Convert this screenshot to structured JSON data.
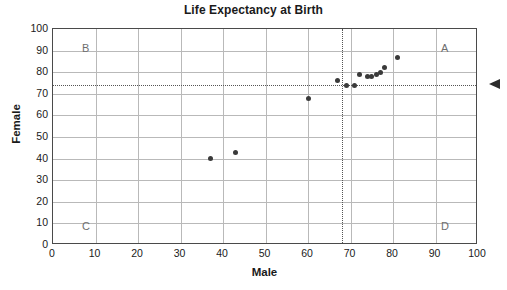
{
  "chart": {
    "title": "Life Expectancy at Birth",
    "xlabel": "Male",
    "ylabel": "Female",
    "quadrants": {
      "top_left": "B",
      "top_right": "A",
      "bottom_left": "C",
      "bottom_right": "D"
    },
    "arrow_marker_name": "reference-line-arrow"
  },
  "chart_data": {
    "type": "scatter",
    "title": "Life Expectancy at Birth",
    "xlabel": "Male",
    "ylabel": "Female",
    "xlim": [
      0,
      100
    ],
    "ylim": [
      0,
      100
    ],
    "xticks": [
      0,
      10,
      20,
      30,
      40,
      50,
      60,
      70,
      80,
      90,
      100
    ],
    "yticks": [
      0,
      10,
      20,
      30,
      40,
      50,
      60,
      70,
      80,
      90,
      100
    ],
    "grid": true,
    "legend": "none",
    "marker_color": "#3a3a3a",
    "reference_lines": {
      "vertical_x": 68,
      "horizontal_y": 74,
      "style": "dotted",
      "color": "#555555"
    },
    "quadrant_annotations": [
      {
        "label": "B",
        "x": 4,
        "y": 95
      },
      {
        "label": "A",
        "x": 96,
        "y": 95
      },
      {
        "label": "C",
        "x": 4,
        "y": 4
      },
      {
        "label": "D",
        "x": 96,
        "y": 4
      }
    ],
    "points": [
      {
        "x": 37,
        "y": 40
      },
      {
        "x": 43,
        "y": 43
      },
      {
        "x": 60,
        "y": 68
      },
      {
        "x": 67,
        "y": 76
      },
      {
        "x": 69,
        "y": 74
      },
      {
        "x": 71,
        "y": 74
      },
      {
        "x": 72,
        "y": 79
      },
      {
        "x": 74,
        "y": 78
      },
      {
        "x": 75,
        "y": 78
      },
      {
        "x": 76,
        "y": 79
      },
      {
        "x": 77,
        "y": 80
      },
      {
        "x": 78,
        "y": 82
      },
      {
        "x": 81,
        "y": 87
      }
    ]
  }
}
